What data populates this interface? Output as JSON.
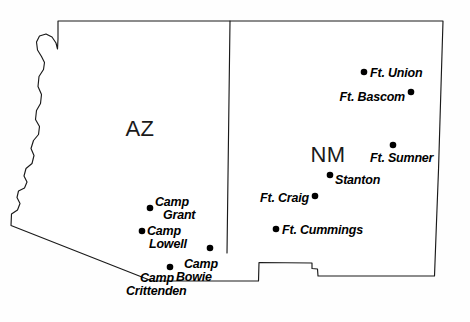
{
  "map": {
    "title": "Arizona and New Mexico Territory Military Posts",
    "background_color": "#ffffff",
    "outline_color": "#1a1a1a",
    "dot_color": "#000000",
    "label_color": "#000000",
    "state_labels": [
      {
        "name": "arizona",
        "text": "AZ",
        "x": 140,
        "y": 136
      },
      {
        "name": "new-mexico",
        "text": "NM",
        "x": 328,
        "y": 162
      }
    ],
    "sites": [
      {
        "id": "ft-union",
        "label": "Ft. Union",
        "lines": [
          "Ft. Union"
        ],
        "dot": {
          "x": 364,
          "y": 72
        },
        "text": {
          "x": 370,
          "y": 76
        },
        "anchor": "start"
      },
      {
        "id": "ft-bascom",
        "label": "Ft. Bascom",
        "lines": [
          "Ft. Bascom"
        ],
        "dot": {
          "x": 411,
          "y": 92
        },
        "text": {
          "x": 406,
          "y": 101
        },
        "anchor": "end"
      },
      {
        "id": "ft-sumner",
        "label": "Ft. Sumner",
        "lines": [
          "Ft. Sumner"
        ],
        "dot": {
          "x": 393,
          "y": 145
        },
        "text": {
          "x": 371,
          "y": 161
        },
        "anchor": "start"
      },
      {
        "id": "stanton",
        "label": "Stanton",
        "lines": [
          "Stanton"
        ],
        "dot": {
          "x": 330,
          "y": 175
        },
        "text": {
          "x": 335,
          "y": 183
        },
        "anchor": "start"
      },
      {
        "id": "ft-craig",
        "label": "Ft. Craig",
        "lines": [
          "Ft. Craig"
        ],
        "dot": {
          "x": 315,
          "y": 196
        },
        "text": {
          "x": 310,
          "y": 201
        },
        "anchor": "end"
      },
      {
        "id": "ft-cummings",
        "label": "Ft. Cummings",
        "lines": [
          "Ft. Cummings"
        ],
        "dot": {
          "x": 276,
          "y": 229
        },
        "text": {
          "x": 282,
          "y": 234
        },
        "anchor": "start"
      },
      {
        "id": "camp-grant",
        "label": "Camp Grant",
        "lines": [
          "Camp",
          "Grant"
        ],
        "dot": {
          "x": 150,
          "y": 208
        },
        "text": {
          "x": 155,
          "y": 205
        },
        "anchor": "start"
      },
      {
        "id": "camp-lowell",
        "label": "Camp Lowell",
        "lines": [
          "Camp",
          "Lowell"
        ],
        "dot": {
          "x": 142,
          "y": 231
        },
        "text": {
          "x": 147,
          "y": 234
        },
        "anchor": "start"
      },
      {
        "id": "camp-bowie",
        "label": "Camp Bowie",
        "lines": [
          "Camp",
          "Bowie"
        ],
        "dot": {
          "x": 210,
          "y": 248
        },
        "text": {
          "x": 186,
          "y": 266
        },
        "anchor": "start"
      },
      {
        "id": "camp-crittenden",
        "label": "Camp Crittenden",
        "lines": [
          "Camp",
          "Crittenden"
        ],
        "dot": {
          "x": 170,
          "y": 267
        },
        "text": {
          "x": 138,
          "y": 281
        },
        "anchor": "start"
      }
    ],
    "borders": {
      "outline_path": "M 37 23 L 37 36 L 40 44 L 45 49 L 51 49 L 56 45 L 59 39 L 62 37 L 64 41 L 64 48 L 62 57 L 58 21 L 220 21 L 443 21 L 441 70 L 440 120 L 438 170 L 436 220 L 434 275 L 317 275 L 317 268 L 312 268 L 312 262 L 258 262 L 258 281 L 152 281 L 11 225 L 12 214 L 18 210 L 20 203 L 17 197 L 18 191 L 24 188 L 27 182 L 24 176 L 26 168 L 32 163 L 34 155 L 31 148 L 33 140 L 38 134 L 39 126 L 35 119 L 36 110 L 40 103 L 41 94 L 38 86 L 39 76 L 43 69 L 44 62 L 41 56 L 37 50 Z",
      "divider_path": "M 230 21 L 227 253"
    }
  }
}
